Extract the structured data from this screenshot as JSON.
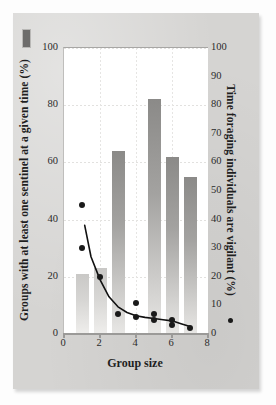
{
  "figure": {
    "panel_marker": "filled-rectangle-swatch",
    "background_color": "#d5d4d2",
    "plot_background_color": "#ffffff",
    "bar_light_color": "#d7d6d4",
    "bar_dark_color": "#8b8a88",
    "point_color": "#1a1a1a"
  },
  "chart_data": {
    "type": "bar",
    "title": "",
    "xlabel": "Group size",
    "ylabel": "Groups with at least one sentinel at a given time (%)",
    "y2label": "Time foraging individuals are vigilant (%)",
    "xlim": [
      0,
      8
    ],
    "ylim": [
      0,
      100
    ],
    "y2lim": [
      0,
      100
    ],
    "xticks": [
      0,
      2,
      4,
      6,
      8
    ],
    "xtick_labels": [
      "0",
      "2",
      "4",
      "6",
      "8"
    ],
    "yticks": [
      0,
      20,
      40,
      60,
      80,
      100
    ],
    "ytick_labels": [
      "0",
      "20",
      "40",
      "60",
      "80",
      "100"
    ],
    "y2ticks": [
      0,
      10,
      20,
      30,
      40,
      50,
      60,
      70,
      80,
      90,
      100
    ],
    "y2tick_labels": [
      "0",
      "10",
      "20",
      "30",
      "40",
      "50",
      "60",
      "70",
      "80",
      "90",
      "100"
    ],
    "grid": true,
    "legend": "none",
    "series": [
      {
        "name": "Groups with at least one sentinel at a given time (%)",
        "type": "bar",
        "axis": "left",
        "categories": [
          1,
          2,
          3,
          5,
          6,
          7
        ],
        "values": [
          21,
          23,
          64,
          82,
          62,
          55
        ],
        "shades": [
          "light",
          "light",
          "dark",
          "dark",
          "dark",
          "dark"
        ]
      },
      {
        "name": "Time foraging individuals are vigilant (%)",
        "type": "scatter",
        "axis": "right",
        "points": [
          {
            "x": 1.0,
            "y": 45
          },
          {
            "x": 1.0,
            "y": 30
          },
          {
            "x": 2.0,
            "y": 20
          },
          {
            "x": 3.0,
            "y": 7
          },
          {
            "x": 4.0,
            "y": 11
          },
          {
            "x": 4.0,
            "y": 6
          },
          {
            "x": 5.0,
            "y": 7
          },
          {
            "x": 5.0,
            "y": 5
          },
          {
            "x": 6.0,
            "y": 5
          },
          {
            "x": 6.0,
            "y": 3
          },
          {
            "x": 7.0,
            "y": 2
          }
        ]
      },
      {
        "name": "fitted decay curve",
        "type": "line",
        "axis": "right",
        "points": [
          {
            "x": 1.15,
            "y": 38
          },
          {
            "x": 1.5,
            "y": 27
          },
          {
            "x": 2.0,
            "y": 19
          },
          {
            "x": 2.5,
            "y": 13
          },
          {
            "x": 3.0,
            "y": 9.5
          },
          {
            "x": 3.5,
            "y": 7.5
          },
          {
            "x": 4.0,
            "y": 6.4
          },
          {
            "x": 4.5,
            "y": 5.8
          },
          {
            "x": 5.0,
            "y": 5.4
          },
          {
            "x": 5.5,
            "y": 5.0
          },
          {
            "x": 6.0,
            "y": 4.6
          },
          {
            "x": 6.5,
            "y": 3.6
          },
          {
            "x": 7.0,
            "y": 2.6
          }
        ]
      }
    ]
  }
}
